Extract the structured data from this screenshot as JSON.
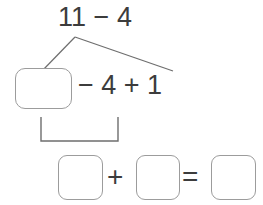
{
  "worksheet": {
    "type": "number-bond-decomposition",
    "top_expression": {
      "text": "11 − 4",
      "minuend": 11,
      "subtrahend": 4
    },
    "middle_expression": {
      "text": "− 4 + 1",
      "leading_blank": true,
      "operator_1": "−",
      "operand_1": 4,
      "operator_2": "+",
      "operand_2": 1
    },
    "bottom_expression": {
      "plus": "+",
      "equals": "=",
      "blank_1": "",
      "blank_2": "",
      "blank_3": ""
    },
    "colors": {
      "text": "#3c3c3c",
      "box_border": "#9c9c9c",
      "connector_line": "#6e6e6e",
      "background": "#ffffff"
    }
  }
}
